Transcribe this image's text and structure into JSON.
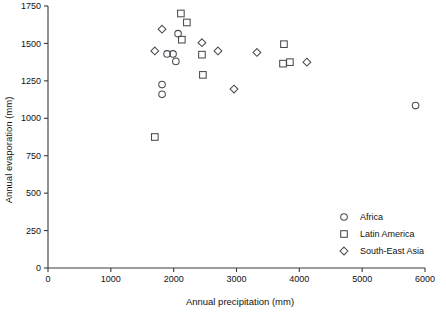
{
  "chart_data": {
    "type": "scatter",
    "title": "",
    "xlabel": "Annual precipitation (mm)",
    "ylabel": "Annual evaporation (mm)",
    "xlim": [
      0,
      6000
    ],
    "ylim": [
      0,
      1750
    ],
    "xticks": [
      0,
      1000,
      2000,
      3000,
      4000,
      5000,
      6000
    ],
    "yticks": [
      0,
      250,
      500,
      750,
      1000,
      1250,
      1500,
      1750
    ],
    "xticklabels": [
      "0",
      "1000",
      "2000",
      "3000",
      "4000",
      "5000",
      "6000"
    ],
    "yticklabels": [
      "0",
      "250",
      "500",
      "750",
      "1000",
      "1250",
      "1500",
      "1750"
    ],
    "grid": false,
    "legend_position": "lower right",
    "series": [
      {
        "name": "Africa",
        "marker": "circle",
        "points": [
          [
            1895,
            1430
          ],
          [
            1990,
            1430
          ],
          [
            2070,
            1565
          ],
          [
            2035,
            1380
          ],
          [
            1815,
            1225
          ],
          [
            1815,
            1160
          ],
          [
            5850,
            1085
          ]
        ]
      },
      {
        "name": "Latin America",
        "marker": "square",
        "points": [
          [
            2115,
            1700
          ],
          [
            2210,
            1640
          ],
          [
            2130,
            1525
          ],
          [
            2450,
            1425
          ],
          [
            2465,
            1290
          ],
          [
            3755,
            1495
          ],
          [
            3740,
            1365
          ],
          [
            3850,
            1375
          ],
          [
            1700,
            875
          ]
        ]
      },
      {
        "name": "South-East Asia",
        "marker": "diamond",
        "points": [
          [
            1815,
            1595
          ],
          [
            1700,
            1450
          ],
          [
            2450,
            1505
          ],
          [
            2705,
            1450
          ],
          [
            2960,
            1195
          ],
          [
            3325,
            1440
          ],
          [
            4120,
            1375
          ]
        ]
      }
    ]
  },
  "legend": {
    "items": [
      {
        "label": "Africa",
        "marker": "circle"
      },
      {
        "label": "Latin America",
        "marker": "square"
      },
      {
        "label": "South-East Asia",
        "marker": "diamond"
      }
    ]
  }
}
